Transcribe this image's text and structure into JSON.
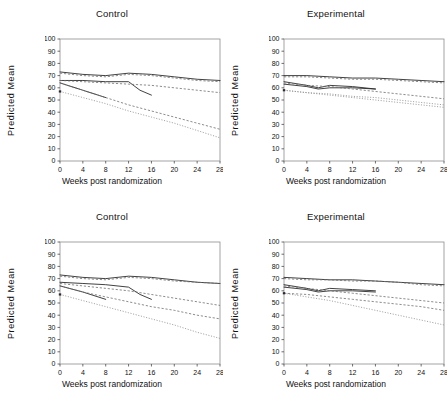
{
  "figure": {
    "layout": "2x2 panel grid",
    "panels": [
      {
        "id": "top-left",
        "title": "Control"
      },
      {
        "id": "top-right",
        "title": "Experimental"
      },
      {
        "id": "bottom-left",
        "title": "Control"
      },
      {
        "id": "bottom-right",
        "title": "Experimental"
      }
    ]
  },
  "axis": {
    "ylabel": "Predicted  Mean",
    "xlabel": "Weeks post randomization",
    "yticks": [
      "0",
      "10",
      "20",
      "30",
      "40",
      "50",
      "60",
      "70",
      "80",
      "90",
      "100"
    ],
    "xticks": [
      "0",
      "4",
      "8",
      "12",
      "16",
      "20",
      "24",
      "28"
    ]
  },
  "chart_data": [
    {
      "type": "line",
      "panel": "top-left",
      "title": "Control",
      "xlabel": "Weeks post randomization",
      "ylabel": "Predicted  Mean",
      "xlim": [
        0,
        28
      ],
      "ylim": [
        0,
        100
      ],
      "xticks": [
        0,
        4,
        8,
        12,
        16,
        20,
        24,
        28
      ],
      "yticks": [
        0,
        10,
        20,
        30,
        40,
        50,
        60,
        70,
        80,
        90,
        100
      ],
      "grid": false,
      "legend": "none",
      "series": [
        {
          "name": "curve-1-solid",
          "style": "solid",
          "x": [
            0,
            4,
            8,
            12,
            16,
            20,
            24,
            28
          ],
          "values": [
            73,
            71,
            70,
            72,
            71,
            69,
            67,
            66
          ]
        },
        {
          "name": "curve-2-dashed",
          "style": "dashed",
          "x": [
            0,
            4,
            8,
            12,
            16,
            20,
            24,
            28
          ],
          "values": [
            72,
            70,
            69,
            71,
            70,
            68,
            66,
            65
          ]
        },
        {
          "name": "curve-3-solid-truncated",
          "style": "solid",
          "x": [
            0,
            4,
            8,
            12,
            14,
            16
          ],
          "values": [
            66,
            66,
            65,
            65,
            58,
            54
          ]
        },
        {
          "name": "curve-4-dashed",
          "style": "dashed",
          "x": [
            0,
            4,
            8,
            12,
            16,
            20,
            24,
            28
          ],
          "values": [
            66,
            65,
            64,
            63,
            62,
            60,
            58,
            56
          ]
        },
        {
          "name": "curve-5-solid-truncated",
          "style": "solid",
          "x": [
            0,
            4,
            8
          ],
          "values": [
            64,
            58,
            52
          ]
        },
        {
          "name": "curve-6-dashed",
          "style": "dashed",
          "x": [
            0,
            4,
            8,
            12,
            16,
            20,
            24,
            28
          ],
          "values": [
            64,
            58,
            52,
            46,
            41,
            36,
            31,
            26
          ]
        },
        {
          "name": "curve-7-dotted",
          "style": "dotted",
          "x": [
            0,
            4,
            8,
            12,
            16,
            20,
            24,
            28
          ],
          "values": [
            57,
            52,
            47,
            41,
            36,
            31,
            25,
            19
          ]
        }
      ]
    },
    {
      "type": "line",
      "panel": "top-right",
      "title": "Experimental",
      "xlabel": "Weeks post randomization",
      "ylabel": "Predicted  Mean",
      "xlim": [
        0,
        28
      ],
      "ylim": [
        0,
        100
      ],
      "xticks": [
        0,
        4,
        8,
        12,
        16,
        20,
        24,
        28
      ],
      "yticks": [
        0,
        10,
        20,
        30,
        40,
        50,
        60,
        70,
        80,
        90,
        100
      ],
      "grid": false,
      "legend": "none",
      "series": [
        {
          "name": "curve-1-solid",
          "style": "solid",
          "x": [
            0,
            4,
            8,
            12,
            16,
            20,
            24,
            28
          ],
          "values": [
            70,
            70,
            69,
            68,
            68,
            67,
            66,
            65
          ]
        },
        {
          "name": "curve-2-dashed",
          "style": "dashed",
          "x": [
            0,
            4,
            8,
            12,
            16,
            20,
            24,
            28
          ],
          "values": [
            69,
            69,
            68,
            67,
            67,
            66,
            65,
            64
          ]
        },
        {
          "name": "curve-3-solid-truncated",
          "style": "solid",
          "x": [
            0,
            4,
            6,
            8,
            12,
            16
          ],
          "values": [
            65,
            62,
            60,
            62,
            61,
            59
          ]
        },
        {
          "name": "curve-4-solid-dip",
          "style": "solid",
          "x": [
            0,
            4,
            6,
            8,
            12,
            16
          ],
          "values": [
            63,
            61,
            59,
            60,
            60,
            59
          ]
        },
        {
          "name": "curve-5-dashed",
          "style": "dashed",
          "x": [
            0,
            4,
            8,
            12,
            16,
            20,
            24,
            28
          ],
          "values": [
            64,
            62,
            61,
            59,
            57,
            55,
            53,
            51
          ]
        },
        {
          "name": "curve-6-dotted",
          "style": "dotted",
          "x": [
            0,
            4,
            8,
            12,
            16,
            20,
            24,
            28
          ],
          "values": [
            58,
            56,
            55,
            53,
            52,
            50,
            48,
            46
          ]
        },
        {
          "name": "curve-7-dotted-lower",
          "style": "dotted",
          "x": [
            0,
            4,
            8,
            12,
            16,
            20,
            24,
            28
          ],
          "values": [
            58,
            56,
            54,
            52,
            50,
            48,
            46,
            44
          ]
        }
      ]
    },
    {
      "type": "line",
      "panel": "bottom-left",
      "title": "Control",
      "xlabel": "Weeks post randomization",
      "ylabel": "Predicted  Mean",
      "xlim": [
        0,
        28
      ],
      "ylim": [
        0,
        100
      ],
      "xticks": [
        0,
        4,
        8,
        12,
        16,
        20,
        24,
        28
      ],
      "yticks": [
        0,
        10,
        20,
        30,
        40,
        50,
        60,
        70,
        80,
        90,
        100
      ],
      "grid": false,
      "legend": "none",
      "series": [
        {
          "name": "curve-1-solid",
          "style": "solid",
          "x": [
            0,
            4,
            8,
            12,
            16,
            20,
            24,
            28
          ],
          "values": [
            73,
            71,
            70,
            72,
            71,
            69,
            67,
            66
          ]
        },
        {
          "name": "curve-2-dashed",
          "style": "dashed",
          "x": [
            0,
            4,
            8,
            12,
            16,
            20,
            24,
            28
          ],
          "values": [
            72,
            70,
            69,
            71,
            70,
            68,
            67,
            66
          ]
        },
        {
          "name": "curve-3-solid-truncated",
          "style": "solid",
          "x": [
            0,
            4,
            8,
            12,
            14,
            16
          ],
          "values": [
            67,
            66,
            65,
            63,
            57,
            53
          ]
        },
        {
          "name": "curve-4-dashed",
          "style": "dashed",
          "x": [
            0,
            4,
            8,
            12,
            16,
            20,
            24,
            28
          ],
          "values": [
            66,
            64,
            62,
            60,
            57,
            54,
            51,
            48
          ]
        },
        {
          "name": "curve-5-solid-truncated",
          "style": "solid",
          "x": [
            0,
            4,
            8
          ],
          "values": [
            64,
            59,
            53
          ]
        },
        {
          "name": "curve-6-dashed",
          "style": "dashed",
          "x": [
            0,
            4,
            8,
            12,
            16,
            20,
            24,
            28
          ],
          "values": [
            64,
            59,
            55,
            51,
            47,
            44,
            40,
            37
          ]
        },
        {
          "name": "curve-7-dotted",
          "style": "dotted",
          "x": [
            0,
            4,
            8,
            12,
            16,
            20,
            24,
            28
          ],
          "values": [
            57,
            52,
            47,
            42,
            37,
            32,
            26,
            21
          ]
        }
      ]
    },
    {
      "type": "line",
      "panel": "bottom-right",
      "title": "Experimental",
      "xlabel": "Weeks post randomization",
      "ylabel": "Predicted  Mean",
      "xlim": [
        0,
        28
      ],
      "ylim": [
        0,
        100
      ],
      "xticks": [
        0,
        4,
        8,
        12,
        16,
        20,
        24,
        28
      ],
      "yticks": [
        0,
        10,
        20,
        30,
        40,
        50,
        60,
        70,
        80,
        90,
        100
      ],
      "grid": false,
      "legend": "none",
      "series": [
        {
          "name": "curve-1-solid",
          "style": "solid",
          "x": [
            0,
            4,
            8,
            12,
            16,
            20,
            24,
            28
          ],
          "values": [
            71,
            70,
            69,
            69,
            68,
            67,
            66,
            65
          ]
        },
        {
          "name": "curve-2-dashed",
          "style": "dashed",
          "x": [
            0,
            4,
            8,
            12,
            16,
            20,
            24,
            28
          ],
          "values": [
            70,
            69,
            69,
            68,
            68,
            67,
            65,
            64
          ]
        },
        {
          "name": "curve-3-solid-truncated",
          "style": "solid",
          "x": [
            0,
            4,
            6,
            8,
            12,
            16
          ],
          "values": [
            65,
            62,
            60,
            62,
            61,
            60
          ]
        },
        {
          "name": "curve-4-solid-dip",
          "style": "solid",
          "x": [
            0,
            4,
            6,
            8,
            12,
            16
          ],
          "values": [
            63,
            61,
            59,
            60,
            60,
            59
          ]
        },
        {
          "name": "curve-5-dashed",
          "style": "dashed",
          "x": [
            0,
            4,
            8,
            12,
            16,
            20,
            24,
            28
          ],
          "values": [
            64,
            62,
            60,
            58,
            56,
            54,
            52,
            50
          ]
        },
        {
          "name": "curve-6-dashed-mid",
          "style": "dashed",
          "x": [
            0,
            4,
            8,
            12,
            16,
            20,
            24,
            28
          ],
          "values": [
            58,
            57,
            55,
            53,
            51,
            49,
            47,
            44
          ]
        },
        {
          "name": "curve-7-dotted",
          "style": "dotted",
          "x": [
            0,
            4,
            8,
            12,
            16,
            20,
            24,
            28
          ],
          "values": [
            58,
            55,
            52,
            48,
            44,
            40,
            36,
            32
          ]
        }
      ]
    }
  ]
}
